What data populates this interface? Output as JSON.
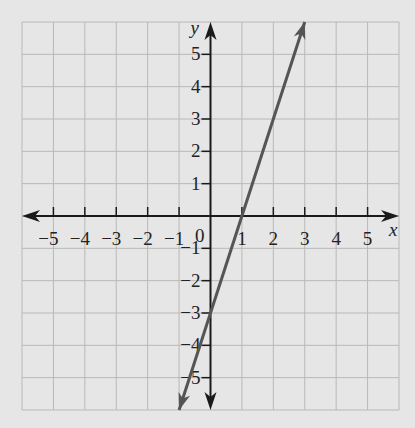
{
  "chart_data": {
    "type": "line",
    "title": "",
    "xlabel": "x",
    "ylabel": "y",
    "xlim": [
      -6,
      6
    ],
    "ylim": [
      -6,
      6
    ],
    "grid": true,
    "x_ticks": [
      -5,
      -4,
      -3,
      -2,
      -1,
      1,
      2,
      3,
      4,
      5
    ],
    "y_ticks": [
      -5,
      -4,
      -3,
      -2,
      -1,
      1,
      2,
      3,
      4,
      5
    ],
    "origin_label": "0",
    "series": [
      {
        "name": "y = 3x - 3",
        "equation": "y = 3x - 3",
        "slope": 3,
        "intercept": -3,
        "x": [
          -1,
          0,
          1,
          2,
          3
        ],
        "y": [
          -6,
          -3,
          0,
          3,
          6
        ],
        "color": "#555555",
        "arrows": "both"
      }
    ],
    "key_points": {
      "x_intercept": [
        1,
        0
      ],
      "y_intercept": [
        0,
        -3
      ]
    }
  },
  "colors": {
    "background": "#e6e6e6",
    "grid": "#b8b8b8",
    "axis": "#1a1a1a",
    "line": "#555555"
  }
}
